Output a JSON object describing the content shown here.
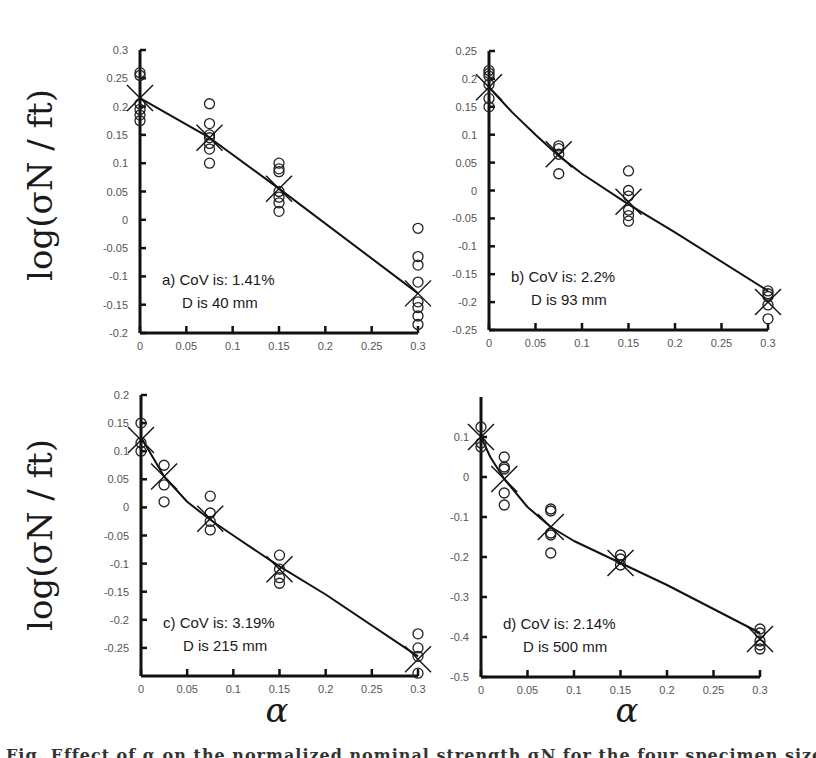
{
  "figure": {
    "ylabel": "log(σN / ft)",
    "xlabel": "α",
    "caption_fragment": "Fig. Effect of α on the normalized nominal strength σN for the four specimen sizes"
  },
  "chart_data": [
    {
      "type": "scatter",
      "panel": "a",
      "annotation_line1": "a) CoV is:  1.41%",
      "annotation_line2": "D is 40 mm",
      "xlabel": "",
      "ylabel": "log(σN / ft)",
      "xlim": [
        0,
        0.3
      ],
      "ylim": [
        -0.2,
        0.3
      ],
      "xticks": [
        0,
        0.05,
        0.1,
        0.15,
        0.2,
        0.25,
        0.3
      ],
      "xtick_labels": [
        "0",
        "0.05",
        "0.1",
        "0.15",
        "0.2",
        "0.25",
        "0.3"
      ],
      "yticks": [
        -0.2,
        -0.15,
        -0.1,
        -0.05,
        0,
        0.05,
        0.1,
        0.15,
        0.2,
        0.25,
        0.3
      ],
      "ytick_labels": [
        "-0.2",
        "-0.15",
        "-0.1",
        "-0.05",
        "0",
        "0.05",
        "0.1",
        "0.15",
        "0.2",
        "0.25",
        "0.3"
      ],
      "grid": false,
      "series": [
        {
          "name": "Experimental (circles)",
          "marker": "o",
          "x": [
            0,
            0,
            0,
            0,
            0,
            0,
            0.075,
            0.075,
            0.075,
            0.075,
            0.075,
            0.075,
            0.075,
            0.15,
            0.15,
            0.15,
            0.15,
            0.15,
            0.15,
            0.15,
            0.3,
            0.3,
            0.3,
            0.3,
            0.3,
            0.3,
            0.3,
            0.3
          ],
          "y": [
            0.26,
            0.255,
            0.205,
            0.195,
            0.185,
            0.175,
            0.205,
            0.17,
            0.15,
            0.145,
            0.135,
            0.125,
            0.1,
            0.1,
            0.09,
            0.085,
            0.05,
            0.04,
            0.03,
            0.015,
            -0.015,
            -0.065,
            -0.08,
            -0.11,
            -0.145,
            -0.155,
            -0.17,
            -0.185
          ]
        },
        {
          "name": "Mean (crosses)",
          "marker": "x",
          "x": [
            0,
            0.075,
            0.15,
            0.3
          ],
          "y": [
            0.215,
            0.145,
            0.055,
            -0.13
          ]
        },
        {
          "name": "Fit",
          "marker": "line",
          "x": [
            0,
            0.075,
            0.15,
            0.3
          ],
          "y": [
            0.215,
            0.145,
            0.055,
            -0.13
          ]
        }
      ]
    },
    {
      "type": "scatter",
      "panel": "b",
      "annotation_line1": "b) CoV is:  2.2%",
      "annotation_line2": "D is 93 mm",
      "xlabel": "",
      "ylabel": "",
      "xlim": [
        0,
        0.3
      ],
      "ylim": [
        -0.25,
        0.25
      ],
      "xticks": [
        0,
        0.05,
        0.1,
        0.15,
        0.2,
        0.25,
        0.3
      ],
      "xtick_labels": [
        "0",
        "0.05",
        "0.1",
        "0.15",
        "0.2",
        "0.25",
        "0.3"
      ],
      "yticks": [
        -0.25,
        -0.2,
        -0.15,
        -0.1,
        -0.05,
        0,
        0.05,
        0.1,
        0.15,
        0.2,
        0.25
      ],
      "ytick_labels": [
        "-0.25",
        "-0.2",
        "-0.15",
        "-0.1",
        "-0.05",
        "0",
        "0.05",
        "0.1",
        "0.15",
        "0.2",
        "0.25"
      ],
      "grid": false,
      "series": [
        {
          "name": "Experimental (circles)",
          "marker": "o",
          "x": [
            0,
            0,
            0,
            0,
            0,
            0,
            0.075,
            0.075,
            0.075,
            0.075,
            0.15,
            0.15,
            0.15,
            0.15,
            0.15,
            0.15,
            0.3,
            0.3,
            0.3,
            0.3,
            0.3
          ],
          "y": [
            0.215,
            0.21,
            0.205,
            0.19,
            0.165,
            0.15,
            0.08,
            0.075,
            0.065,
            0.03,
            0.035,
            0.0,
            -0.01,
            -0.035,
            -0.045,
            -0.055,
            -0.18,
            -0.185,
            -0.19,
            -0.205,
            -0.23
          ]
        },
        {
          "name": "Mean (crosses)",
          "marker": "x",
          "x": [
            0,
            0.075,
            0.15,
            0.3
          ],
          "y": [
            0.185,
            0.065,
            -0.02,
            -0.2
          ]
        },
        {
          "name": "Fit",
          "marker": "line",
          "x": [
            0,
            0.025,
            0.05,
            0.075,
            0.1,
            0.15,
            0.2,
            0.3
          ],
          "y": [
            0.185,
            0.14,
            0.1,
            0.062,
            0.03,
            -0.025,
            -0.075,
            -0.18
          ]
        }
      ]
    },
    {
      "type": "scatter",
      "panel": "c",
      "annotation_line1": "c) CoV is:  3.19%",
      "annotation_line2": "D is 215 mm",
      "xlabel": "α",
      "ylabel": "log(σN / ft)",
      "xlim": [
        0,
        0.3
      ],
      "ylim": [
        -0.3,
        0.2
      ],
      "xticks": [
        0,
        0.05,
        0.1,
        0.15,
        0.2,
        0.25,
        0.3
      ],
      "xtick_labels": [
        "0",
        "0.05",
        "0.1",
        "0.15",
        "0.2",
        "0.25",
        "0.3"
      ],
      "yticks": [
        -0.25,
        -0.2,
        -0.15,
        -0.1,
        -0.05,
        0,
        0.05,
        0.1,
        0.15,
        0.2
      ],
      "ytick_labels": [
        "-0.25",
        "-0.2",
        "-0.15",
        "-0.1",
        "-0.05",
        "0",
        "0.05",
        "0.1",
        "0.15",
        "0.2"
      ],
      "grid": false,
      "series": [
        {
          "name": "Experimental (circles)",
          "marker": "o",
          "x": [
            0,
            0,
            0,
            0.025,
            0.025,
            0.025,
            0.075,
            0.075,
            0.075,
            0.075,
            0.15,
            0.15,
            0.15,
            0.15,
            0.3,
            0.3,
            0.3,
            0.3
          ],
          "y": [
            0.15,
            0.115,
            0.1,
            0.075,
            0.04,
            0.01,
            0.02,
            -0.01,
            -0.025,
            -0.04,
            -0.085,
            -0.11,
            -0.125,
            -0.135,
            -0.225,
            -0.25,
            -0.265,
            -0.295
          ]
        },
        {
          "name": "Mean (crosses)",
          "marker": "x",
          "x": [
            0,
            0.025,
            0.075,
            0.15,
            0.3
          ],
          "y": [
            0.12,
            0.055,
            -0.02,
            -0.11,
            -0.27
          ]
        },
        {
          "name": "Fit",
          "marker": "line",
          "x": [
            0,
            0.0125,
            0.025,
            0.05,
            0.075,
            0.1,
            0.15,
            0.2,
            0.3
          ],
          "y": [
            0.125,
            0.09,
            0.055,
            0.01,
            -0.022,
            -0.05,
            -0.105,
            -0.155,
            -0.265
          ]
        }
      ]
    },
    {
      "type": "scatter",
      "panel": "d",
      "annotation_line1": "d) CoV is:  2.14%",
      "annotation_line2": "D is 500 mm",
      "xlabel": "α",
      "ylabel": "",
      "xlim": [
        0,
        0.3
      ],
      "ylim": [
        -0.5,
        0.2
      ],
      "xticks": [
        0,
        0.05,
        0.1,
        0.15,
        0.2,
        0.25,
        0.3
      ],
      "xtick_labels": [
        "0",
        "0.05",
        "0.1",
        "0.15",
        "0.2",
        "0.25",
        "0.3"
      ],
      "yticks": [
        -0.5,
        -0.4,
        -0.3,
        -0.2,
        -0.1,
        0,
        0.1
      ],
      "ytick_labels": [
        "-0.5",
        "-0.4",
        "-0.3",
        "-0.2",
        "-0.1",
        "0",
        "0.1"
      ],
      "grid": false,
      "series": [
        {
          "name": "Experimental (circles)",
          "marker": "o",
          "x": [
            0,
            0,
            0,
            0.025,
            0.025,
            0.025,
            0.025,
            0.025,
            0.075,
            0.075,
            0.075,
            0.075,
            0.075,
            0.15,
            0.15,
            0.15,
            0.3,
            0.3,
            0.3,
            0.3,
            0.3
          ],
          "y": [
            0.125,
            0.085,
            0.075,
            0.05,
            0.025,
            0.02,
            -0.04,
            -0.07,
            -0.08,
            -0.085,
            -0.14,
            -0.145,
            -0.19,
            -0.195,
            -0.205,
            -0.22,
            -0.38,
            -0.39,
            -0.41,
            -0.42,
            -0.43
          ]
        },
        {
          "name": "Mean (crosses)",
          "marker": "x",
          "x": [
            0,
            0.025,
            0.075,
            0.15,
            0.3
          ],
          "y": [
            0.1,
            -0.005,
            -0.125,
            -0.215,
            -0.405
          ]
        },
        {
          "name": "Fit",
          "marker": "line",
          "x": [
            0,
            0.01,
            0.025,
            0.05,
            0.075,
            0.1,
            0.15,
            0.2,
            0.3
          ],
          "y": [
            0.1,
            0.05,
            -0.005,
            -0.075,
            -0.125,
            -0.16,
            -0.215,
            -0.27,
            -0.39
          ]
        }
      ]
    }
  ],
  "layout": {
    "panels": [
      {
        "x0": 140,
        "x1": 418,
        "ytop": 50,
        "ybot": 333
      },
      {
        "x0": 489,
        "x1": 768,
        "ytop": 51,
        "ybot": 330
      },
      {
        "x0": 141,
        "x1": 418,
        "ytop": 395,
        "ybot": 676
      },
      {
        "x0": 481,
        "x1": 760,
        "ytop": 397,
        "ybot": 677
      }
    ]
  }
}
